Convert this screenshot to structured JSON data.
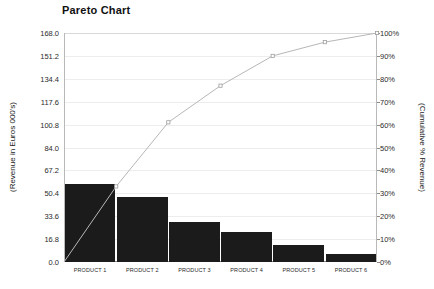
{
  "chart_data": {
    "type": "bar",
    "title": "Pareto Chart",
    "xlabel": "",
    "ylabel": "(Revenue in Euros 000's)",
    "y2label": "(Cumulative % Revenue)",
    "categories": [
      "PRODUCT 1",
      "PRODUCT 2",
      "PRODUCT 3",
      "PRODUCT 4",
      "PRODUCT 5",
      "PRODUCT 6"
    ],
    "series": [
      {
        "name": "Revenue",
        "type": "bar",
        "axis": "left",
        "values": [
          57.0,
          47.6,
          29.4,
          22.0,
          12.6,
          6.0
        ],
        "color": "#1b1b1b"
      },
      {
        "name": "Cumulative % Revenue",
        "type": "line",
        "axis": "right",
        "values": [
          33,
          61,
          77,
          90,
          96,
          100
        ],
        "color": "#b7b7b7"
      }
    ],
    "ylim": [
      0,
      168
    ],
    "y2lim": [
      0,
      100
    ],
    "yticks": [
      "0.0",
      "16.8",
      "33.6",
      "50.4",
      "67.2",
      "84.0",
      "100.8",
      "117.6",
      "134.4",
      "151.2",
      "168.0"
    ],
    "ytick_values": [
      0,
      16.8,
      33.6,
      50.4,
      67.2,
      84.0,
      100.8,
      117.6,
      134.4,
      151.2,
      168.0
    ],
    "y2ticks": [
      "0%",
      "10%",
      "20%",
      "30%",
      "40%",
      "50%",
      "60%",
      "70%",
      "80%",
      "90%",
      "100%"
    ],
    "y2tick_values": [
      0,
      10,
      20,
      30,
      40,
      50,
      60,
      70,
      80,
      90,
      100
    ],
    "grid": true,
    "legend": "none",
    "background": "#ffffff",
    "grid_color": "#ededed",
    "axis_color": "#8a8a8a"
  }
}
